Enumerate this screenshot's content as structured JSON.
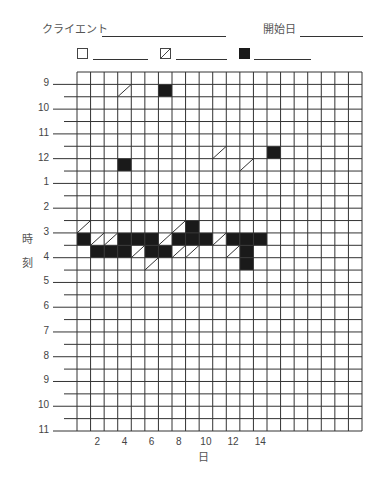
{
  "header": {
    "client_label": "クライエント",
    "start_date_label": "開始日"
  },
  "legend": [
    {
      "symbol": "empty",
      "label": ""
    },
    {
      "symbol": "diagonal",
      "label": ""
    },
    {
      "symbol": "filled",
      "label": ""
    }
  ],
  "colors": {
    "grid": "#333333",
    "fill": "#1a1a1a",
    "text": "#444444"
  },
  "chart_data": {
    "type": "heatmap",
    "title": "",
    "xlabel": "日",
    "ylabel": "時刻",
    "x_tick_labels": [
      "2",
      "4",
      "6",
      "8",
      "10",
      "12",
      "14"
    ],
    "x_tick_days": [
      2,
      4,
      6,
      8,
      10,
      12,
      14
    ],
    "y_tick_labels": [
      "9",
      "10",
      "11",
      "12",
      "1",
      "2",
      "3",
      "4",
      "5",
      "6",
      "7",
      "8",
      "9",
      "10",
      "11"
    ],
    "grid": {
      "columns": 21,
      "rows": 29,
      "row_unit": "30 min",
      "first_tick_row": 1,
      "column_day_offset": 1
    },
    "legend_entries": [
      "empty (□)",
      "diagonal (▨)",
      "filled (■)"
    ],
    "marks": [
      {
        "day": 4,
        "time": "9:00-9:30",
        "type": "diagonal"
      },
      {
        "day": 7,
        "time": "9:00-9:30",
        "type": "filled"
      },
      {
        "day": 11,
        "time": "11:30-12:00",
        "type": "diagonal"
      },
      {
        "day": 15,
        "time": "11:30-12:00",
        "type": "filled"
      },
      {
        "day": 4,
        "time": "12:00-12:30",
        "type": "filled"
      },
      {
        "day": 13,
        "time": "12:00-12:30",
        "type": "diagonal"
      },
      {
        "day": 1,
        "time": "2:30-3:00",
        "type": "diagonal"
      },
      {
        "day": 8,
        "time": "2:30-3:00",
        "type": "diagonal"
      },
      {
        "day": 9,
        "time": "2:30-3:00",
        "type": "filled"
      },
      {
        "day": 1,
        "time": "3:00-3:30",
        "type": "filled"
      },
      {
        "day": 2,
        "time": "3:00-3:30",
        "type": "diagonal"
      },
      {
        "day": 3,
        "time": "3:00-3:30",
        "type": "diagonal"
      },
      {
        "day": 4,
        "time": "3:00-3:30",
        "type": "filled"
      },
      {
        "day": 5,
        "time": "3:00-3:30",
        "type": "filled"
      },
      {
        "day": 6,
        "time": "3:00-3:30",
        "type": "filled"
      },
      {
        "day": 7,
        "time": "3:00-3:30",
        "type": "diagonal"
      },
      {
        "day": 8,
        "time": "3:00-3:30",
        "type": "filled"
      },
      {
        "day": 9,
        "time": "3:00-3:30",
        "type": "filled"
      },
      {
        "day": 10,
        "time": "3:00-3:30",
        "type": "filled"
      },
      {
        "day": 11,
        "time": "3:00-3:30",
        "type": "diagonal"
      },
      {
        "day": 12,
        "time": "3:00-3:30",
        "type": "filled"
      },
      {
        "day": 13,
        "time": "3:00-3:30",
        "type": "filled"
      },
      {
        "day": 14,
        "time": "3:00-3:30",
        "type": "filled"
      },
      {
        "day": 2,
        "time": "3:30-4:00",
        "type": "filled"
      },
      {
        "day": 3,
        "time": "3:30-4:00",
        "type": "filled"
      },
      {
        "day": 4,
        "time": "3:30-4:00",
        "type": "filled"
      },
      {
        "day": 5,
        "time": "3:30-4:00",
        "type": "diagonal"
      },
      {
        "day": 6,
        "time": "3:30-4:00",
        "type": "filled"
      },
      {
        "day": 7,
        "time": "3:30-4:00",
        "type": "filled"
      },
      {
        "day": 8,
        "time": "3:30-4:00",
        "type": "diagonal"
      },
      {
        "day": 9,
        "time": "3:30-4:00",
        "type": "diagonal"
      },
      {
        "day": 12,
        "time": "3:30-4:00",
        "type": "diagonal"
      },
      {
        "day": 13,
        "time": "3:30-4:00",
        "type": "filled"
      },
      {
        "day": 6,
        "time": "4:00-4:30",
        "type": "diagonal"
      },
      {
        "day": 13,
        "time": "4:00-4:30",
        "type": "filled"
      }
    ],
    "cells": [
      {
        "col": 3,
        "row": 1,
        "type": "diagonal"
      },
      {
        "col": 6,
        "row": 1,
        "type": "filled"
      },
      {
        "col": 10,
        "row": 6,
        "type": "diagonal"
      },
      {
        "col": 14,
        "row": 6,
        "type": "filled"
      },
      {
        "col": 3,
        "row": 7,
        "type": "filled"
      },
      {
        "col": 12,
        "row": 7,
        "type": "diagonal"
      },
      {
        "col": 0,
        "row": 12,
        "type": "diagonal"
      },
      {
        "col": 7,
        "row": 12,
        "type": "diagonal"
      },
      {
        "col": 8,
        "row": 12,
        "type": "filled"
      },
      {
        "col": 0,
        "row": 13,
        "type": "filled"
      },
      {
        "col": 1,
        "row": 13,
        "type": "diagonal"
      },
      {
        "col": 2,
        "row": 13,
        "type": "diagonal"
      },
      {
        "col": 3,
        "row": 13,
        "type": "filled"
      },
      {
        "col": 4,
        "row": 13,
        "type": "filled"
      },
      {
        "col": 5,
        "row": 13,
        "type": "filled"
      },
      {
        "col": 6,
        "row": 13,
        "type": "diagonal"
      },
      {
        "col": 7,
        "row": 13,
        "type": "filled"
      },
      {
        "col": 8,
        "row": 13,
        "type": "filled"
      },
      {
        "col": 9,
        "row": 13,
        "type": "filled"
      },
      {
        "col": 10,
        "row": 13,
        "type": "diagonal"
      },
      {
        "col": 11,
        "row": 13,
        "type": "filled"
      },
      {
        "col": 12,
        "row": 13,
        "type": "filled"
      },
      {
        "col": 13,
        "row": 13,
        "type": "filled"
      },
      {
        "col": 1,
        "row": 14,
        "type": "filled"
      },
      {
        "col": 2,
        "row": 14,
        "type": "filled"
      },
      {
        "col": 3,
        "row": 14,
        "type": "filled"
      },
      {
        "col": 4,
        "row": 14,
        "type": "diagonal"
      },
      {
        "col": 5,
        "row": 14,
        "type": "filled"
      },
      {
        "col": 6,
        "row": 14,
        "type": "filled"
      },
      {
        "col": 7,
        "row": 14,
        "type": "diagonal"
      },
      {
        "col": 8,
        "row": 14,
        "type": "diagonal"
      },
      {
        "col": 11,
        "row": 14,
        "type": "diagonal"
      },
      {
        "col": 12,
        "row": 14,
        "type": "filled"
      },
      {
        "col": 5,
        "row": 15,
        "type": "diagonal"
      },
      {
        "col": 12,
        "row": 15,
        "type": "filled"
      }
    ]
  }
}
